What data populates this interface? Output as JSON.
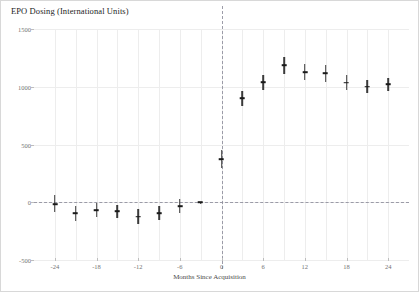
{
  "chart_data": {
    "type": "scatter",
    "title": "EPO Dosing (International Units)",
    "xlabel": "Months Since Acquisition",
    "ylabel": "",
    "xlim": [
      -27,
      27
    ],
    "ylim": [
      -500,
      1500
    ],
    "yticks": [
      1500,
      1000,
      500,
      0,
      -500
    ],
    "xticks": [
      -24,
      -18,
      -12,
      -6,
      0,
      6,
      12,
      18,
      24
    ],
    "grid": true,
    "legend": false,
    "reference_lines": [
      {
        "axis": "y",
        "value": 0,
        "style": "dashed"
      },
      {
        "axis": "x",
        "value": 0,
        "style": "dashed"
      }
    ],
    "series": [
      {
        "name": "EPO Dosing Estimate",
        "marker": "point-with-error-bar",
        "points": [
          {
            "x": -24,
            "y": -20,
            "lo": -85,
            "hi": 60
          },
          {
            "x": -21,
            "y": -95,
            "lo": -160,
            "hi": -30
          },
          {
            "x": -18,
            "y": -70,
            "lo": -130,
            "hi": -10
          },
          {
            "x": -15,
            "y": -80,
            "lo": -140,
            "hi": -20
          },
          {
            "x": -12,
            "y": -125,
            "lo": -190,
            "hi": -60
          },
          {
            "x": -9,
            "y": -95,
            "lo": -155,
            "hi": -35
          },
          {
            "x": -6,
            "y": -35,
            "lo": -95,
            "hi": 25
          },
          {
            "x": -3,
            "y": 0,
            "lo": 0,
            "hi": 0
          },
          {
            "x": 0,
            "y": 375,
            "lo": 300,
            "hi": 450
          },
          {
            "x": 3,
            "y": 900,
            "lo": 835,
            "hi": 965
          },
          {
            "x": 6,
            "y": 1040,
            "lo": 975,
            "hi": 1105
          },
          {
            "x": 9,
            "y": 1185,
            "lo": 1110,
            "hi": 1255
          },
          {
            "x": 12,
            "y": 1125,
            "lo": 1055,
            "hi": 1195
          },
          {
            "x": 15,
            "y": 1115,
            "lo": 1045,
            "hi": 1185
          },
          {
            "x": 18,
            "y": 1035,
            "lo": 975,
            "hi": 1100
          },
          {
            "x": 21,
            "y": 1000,
            "lo": 945,
            "hi": 1060
          },
          {
            "x": 24,
            "y": 1020,
            "lo": 960,
            "hi": 1080
          }
        ]
      }
    ]
  },
  "colors": {
    "marker": "#1a1a1a",
    "grid": "#ededed",
    "reference_line": "#8d8d9b",
    "frame": "#d8d8d8",
    "tick_label": "#737373"
  }
}
